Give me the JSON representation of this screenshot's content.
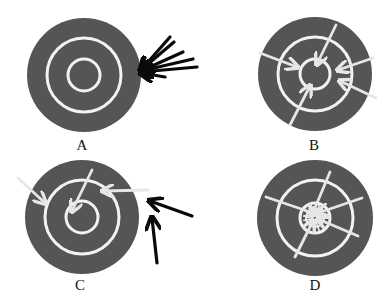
{
  "colors": {
    "target_fill": "#555555",
    "ring": "#f2f2f2",
    "white_arrow": "#e6e6e6",
    "black_arrow": "#0a0a0a",
    "background": "#ffffff"
  },
  "targets": [
    {
      "id": "A",
      "label": "A",
      "cx": 84,
      "cy": 75,
      "r": 57,
      "outer_ring_r": 37,
      "inner_ring_r": 16,
      "label_x": 82,
      "label_y": 138,
      "arrows": [
        {
          "color": "black",
          "x1": 170,
          "y1": 37,
          "x2": 141,
          "y2": 70
        },
        {
          "color": "black",
          "x1": 174,
          "y1": 42,
          "x2": 141,
          "y2": 70
        },
        {
          "color": "black",
          "x1": 183,
          "y1": 52,
          "x2": 141,
          "y2": 71
        },
        {
          "color": "black",
          "x1": 193,
          "y1": 59,
          "x2": 141,
          "y2": 71
        },
        {
          "color": "black",
          "x1": 197,
          "y1": 67,
          "x2": 141,
          "y2": 72
        },
        {
          "color": "black",
          "x1": 165,
          "y1": 77,
          "x2": 141,
          "y2": 73
        }
      ]
    },
    {
      "id": "B",
      "label": "B",
      "cx": 315,
      "cy": 74,
      "r": 57,
      "outer_ring_r": 37,
      "inner_ring_r": 15,
      "label_x": 314,
      "label_y": 138,
      "arrows": [
        {
          "color": "white",
          "x1": 260,
          "y1": 53,
          "x2": 297,
          "y2": 67
        },
        {
          "color": "white",
          "x1": 336,
          "y1": 25,
          "x2": 317,
          "y2": 64
        },
        {
          "color": "white",
          "x1": 373,
          "y1": 58,
          "x2": 338,
          "y2": 70
        },
        {
          "color": "white",
          "x1": 376,
          "y1": 98,
          "x2": 340,
          "y2": 81
        },
        {
          "color": "white",
          "x1": 290,
          "y1": 125,
          "x2": 310,
          "y2": 86
        }
      ]
    },
    {
      "id": "C",
      "label": "C",
      "cx": 82,
      "cy": 217,
      "r": 57,
      "outer_ring_r": 37,
      "inner_ring_r": 16,
      "label_x": 80,
      "label_y": 278,
      "arrows": [
        {
          "color": "white",
          "x1": 18,
          "y1": 178,
          "x2": 45,
          "y2": 203
        },
        {
          "color": "white",
          "x1": 92,
          "y1": 170,
          "x2": 72,
          "y2": 211
        },
        {
          "color": "white",
          "x1": 148,
          "y1": 190,
          "x2": 103,
          "y2": 191
        },
        {
          "color": "black",
          "x1": 192,
          "y1": 216,
          "x2": 150,
          "y2": 201
        },
        {
          "color": "black",
          "x1": 157,
          "y1": 263,
          "x2": 152,
          "y2": 218
        }
      ]
    },
    {
      "id": "D",
      "label": "D",
      "cx": 315,
      "cy": 218,
      "r": 58,
      "outer_ring_r": 38,
      "inner_ring_r": 15,
      "label_x": 315,
      "label_y": 278,
      "arrows": [
        {
          "color": "white",
          "x1": 266,
          "y1": 197,
          "x2": 316,
          "y2": 214
        },
        {
          "color": "white",
          "x1": 330,
          "y1": 172,
          "x2": 312,
          "y2": 215
        },
        {
          "color": "white",
          "x1": 362,
          "y1": 198,
          "x2": 318,
          "y2": 213
        },
        {
          "color": "white",
          "x1": 358,
          "y1": 236,
          "x2": 318,
          "y2": 219
        },
        {
          "color": "white",
          "x1": 295,
          "y1": 257,
          "x2": 313,
          "y2": 221
        }
      ],
      "center_scribble": true
    }
  ]
}
